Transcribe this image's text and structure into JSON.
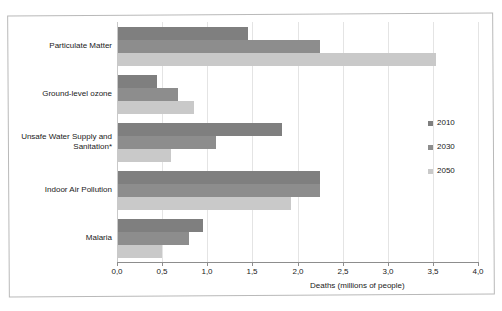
{
  "chart_data": {
    "type": "bar",
    "orientation": "horizontal",
    "title": "",
    "xlabel": "Deaths (millions of people)",
    "ylabel": "",
    "xlim": [
      0.0,
      4.0
    ],
    "xticks": [
      "0,0",
      "0,5",
      "1,0",
      "1,5",
      "2,0",
      "2,5",
      "3,0",
      "3,5",
      "4,0"
    ],
    "xtick_values": [
      0.0,
      0.5,
      1.0,
      1.5,
      2.0,
      2.5,
      3.0,
      3.5,
      4.0
    ],
    "grid": true,
    "legend_position": "right",
    "decimal_separator": ",",
    "categories": [
      "Particulate Matter",
      "Ground-level ozone",
      "Unsafe Water Supply and Sanitation*",
      "Indoor Air Pollution",
      "Malaria"
    ],
    "series": [
      {
        "name": "2010",
        "color": "#7f7f7f",
        "values": [
          1.45,
          0.44,
          1.83,
          2.25,
          0.95
        ]
      },
      {
        "name": "2030",
        "color": "#8d8d8d",
        "values": [
          2.25,
          0.68,
          1.1,
          2.25,
          0.8
        ]
      },
      {
        "name": "2050",
        "color": "#c9c9c9",
        "values": [
          3.53,
          0.85,
          0.6,
          1.93,
          0.5
        ]
      }
    ]
  },
  "axis": {
    "x_title": "Deaths (millions of people)"
  },
  "legend": {
    "items": [
      {
        "label": "2010"
      },
      {
        "label": "2030"
      },
      {
        "label": "2050"
      }
    ]
  },
  "categories": [
    {
      "label": "Particulate Matter"
    },
    {
      "label": "Ground-level ozone"
    },
    {
      "label": "Unsafe Water Supply and Sanitation*"
    },
    {
      "label": "Indoor Air Pollution"
    },
    {
      "label": "Malaria"
    }
  ],
  "ticks": [
    {
      "label": "0,0"
    },
    {
      "label": "0,5"
    },
    {
      "label": "1,0"
    },
    {
      "label": "1,5"
    },
    {
      "label": "2,0"
    },
    {
      "label": "2,5"
    },
    {
      "label": "3,0"
    },
    {
      "label": "3,5"
    },
    {
      "label": "4,0"
    }
  ]
}
